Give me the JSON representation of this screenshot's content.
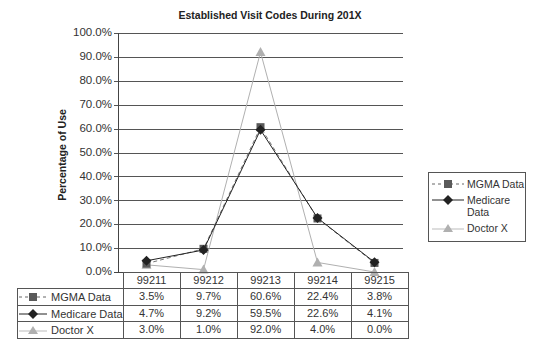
{
  "chart_data": {
    "type": "line",
    "title": "Established Visit Codes During 201X",
    "xlabel": "",
    "ylabel": "Percentage of Use",
    "categories": [
      "99211",
      "99212",
      "99213",
      "99214",
      "99215"
    ],
    "series": [
      {
        "name": "MGMA Data",
        "values": [
          3.5,
          9.7,
          60.6,
          22.4,
          3.8
        ],
        "display": [
          "3.5%",
          "9.7%",
          "60.6%",
          "22.4%",
          "3.8%"
        ],
        "color": "#555555",
        "marker": "square",
        "line": "dashed"
      },
      {
        "name": "Medicare Data",
        "values": [
          4.7,
          9.2,
          59.5,
          22.6,
          4.1
        ],
        "display": [
          "4.7%",
          "9.2%",
          "59.5%",
          "22.6%",
          "4.1%"
        ],
        "color": "#222222",
        "marker": "diamond",
        "line": "solid"
      },
      {
        "name": "Doctor X",
        "values": [
          3.0,
          1.0,
          92.0,
          4.0,
          0.0
        ],
        "display": [
          "3.0%",
          "1.0%",
          "92.0%",
          "4.0%",
          "0.0%"
        ],
        "color": "#b0b0b0",
        "marker": "triangle",
        "line": "solid"
      }
    ],
    "yticks": [
      "100.0%",
      "90.0%",
      "80.0%",
      "70.0%",
      "60.0%",
      "50.0%",
      "40.0%",
      "30.0%",
      "20.0%",
      "10.0%",
      "0.0%"
    ],
    "ylim": [
      0,
      100
    ],
    "grid": true,
    "legend_position": "right",
    "data_table": true
  },
  "legend": {
    "items": [
      {
        "label": "MGMA Data"
      },
      {
        "label": "Medicare Data"
      },
      {
        "label": "Doctor X"
      }
    ]
  }
}
